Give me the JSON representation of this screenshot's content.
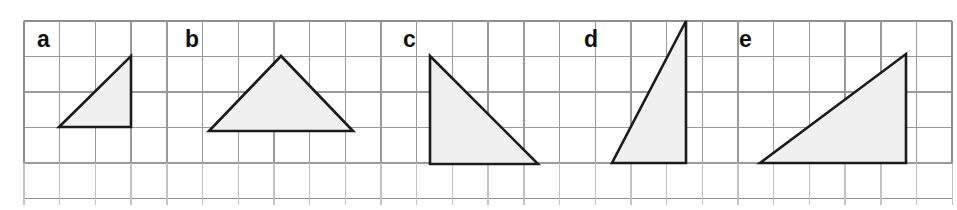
{
  "figure": {
    "width": 957,
    "height": 210,
    "background_color": "#ffffff"
  },
  "grid": {
    "origin_x": 24,
    "origin_y": 21,
    "cell_width": 35.7,
    "cell_height": 35.5,
    "columns": 26,
    "rows": 5,
    "line_color": "#9a9a9a",
    "border_color": "#8e8e8e",
    "faint_line_color": "#c2c2c2"
  },
  "style": {
    "triangle_fill": "#f0f0f0",
    "triangle_stroke": "#1b1b1b",
    "label_color": "#111111"
  },
  "shapes": [
    {
      "label": "a",
      "label_x": 37,
      "label_y": 47,
      "points": "59,127 131,127 131,56",
      "base_cells": 2,
      "height_cells": 2
    },
    {
      "label": "b",
      "label_x": 185,
      "label_y": 47,
      "points": "209,131 353,131 281,56",
      "base_cells": 4,
      "height_cells": 2
    },
    {
      "label": "c",
      "label_x": 403,
      "label_y": 47,
      "points": "430,56 430,164 538,164",
      "base_cells": 3,
      "height_cells": 3
    },
    {
      "label": "d",
      "label_x": 584,
      "label_y": 47,
      "points": "612,163 686,163 686,21",
      "base_cells": 2,
      "height_cells": 4
    },
    {
      "label": "e",
      "label_x": 739,
      "label_y": 47,
      "points": "760,163 906,163 906,54",
      "base_cells": 4,
      "height_cells": 3
    }
  ]
}
